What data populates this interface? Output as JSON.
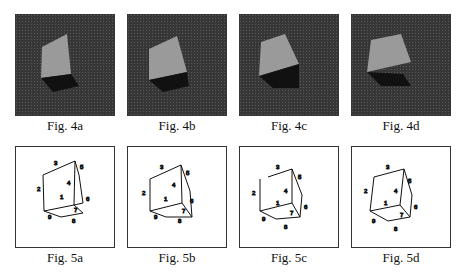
{
  "figures_row1": [
    {
      "caption": "Fig. 4a",
      "description": "grayscale photo of a cube on a dark textured background"
    },
    {
      "caption": "Fig. 4b",
      "description": "grayscale photo of a cube on a dark textured background"
    },
    {
      "caption": "Fig. 4c",
      "description": "grayscale photo of a cube on a dark textured background"
    },
    {
      "caption": "Fig. 4d",
      "description": "grayscale photo of a cube on a dark textured background"
    }
  ],
  "figures_row2": [
    {
      "caption": "Fig. 5a",
      "edge_labels": [
        "1",
        "2",
        "3",
        "4",
        "5",
        "6",
        "7",
        "8",
        "9"
      ]
    },
    {
      "caption": "Fig. 5b",
      "edge_labels": [
        "1",
        "2",
        "3",
        "4",
        "5",
        "6",
        "7",
        "8",
        "9"
      ]
    },
    {
      "caption": "Fig. 5c",
      "edge_labels": [
        "1",
        "2",
        "3",
        "4",
        "5",
        "6",
        "7",
        "8",
        "9"
      ]
    },
    {
      "caption": "Fig. 5d",
      "edge_labels": [
        "1",
        "2",
        "3",
        "4",
        "5",
        "6",
        "7",
        "8",
        "9"
      ]
    }
  ]
}
